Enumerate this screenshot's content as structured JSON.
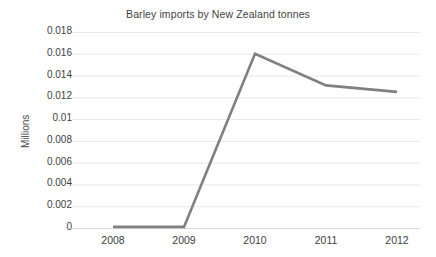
{
  "chart_data": {
    "type": "line",
    "title": "Barley imports by New Zealand tonnes",
    "xlabel": "",
    "ylabel": "Millions",
    "categories": [
      "2008",
      "2009",
      "2010",
      "2011",
      "2012"
    ],
    "x": [
      2008,
      2009,
      2010,
      2011,
      2012
    ],
    "values": [
      0.0001,
      0.0001,
      0.016,
      0.0131,
      0.0125
    ],
    "series": [
      {
        "name": "Barley imports",
        "values": [
          0.0001,
          0.0001,
          0.016,
          0.0131,
          0.0125
        ]
      }
    ],
    "ylim": [
      0,
      0.018
    ],
    "ytick_labels": [
      "0.018",
      "0.016",
      "0.014",
      "0.012",
      "0.01",
      "0.008",
      "0.006",
      "0.004",
      "0.002",
      "0"
    ],
    "ytick_values": [
      0.018,
      0.016,
      0.014,
      0.012,
      0.01,
      0.008,
      0.006,
      0.004,
      0.002,
      0
    ],
    "xtick_labels": [
      "2008",
      "2009",
      "2010",
      "2011",
      "2012"
    ],
    "grid": "horizontal",
    "legend": "none",
    "colors": {
      "line": "#808080",
      "gridline": "#e8e8e8",
      "text": "#404040",
      "background": "#ffffff"
    }
  }
}
